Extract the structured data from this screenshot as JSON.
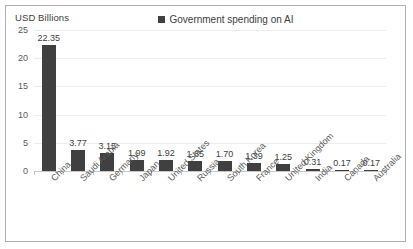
{
  "chart_data": {
    "type": "bar",
    "title": "",
    "ylabel": "USD Billions",
    "xlabel": "",
    "ylim": [
      0,
      25
    ],
    "yticks": [
      25,
      20,
      15,
      10,
      5,
      0
    ],
    "grid": true,
    "legend_position": "top-center",
    "legend": [
      "Government spending on AI"
    ],
    "series_name": "Government spending on AI",
    "bar_color": "#404040",
    "categories": [
      "China",
      "Saudi Arabia",
      "Germany",
      "Japan",
      "United States",
      "Russia",
      "South Korea",
      "France",
      "United Kingdom",
      "India",
      "Canada",
      "Australia"
    ],
    "values": [
      22.35,
      3.77,
      3.15,
      1.99,
      1.92,
      1.85,
      1.7,
      1.39,
      1.25,
      0.31,
      0.17,
      0.17
    ],
    "value_labels": [
      "22.35",
      "3.77",
      "3.15",
      "1.99",
      "1.92",
      "1.85",
      "1.70",
      "1.39",
      "1.25",
      "0.31",
      "0.17",
      "0.17"
    ]
  },
  "legend": {
    "label": "Government spending on AI",
    "swatch_color": "#404040"
  },
  "axis": {
    "y_title": "USD Billions"
  }
}
